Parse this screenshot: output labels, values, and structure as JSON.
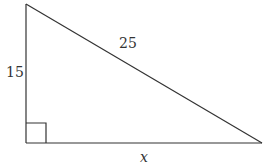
{
  "diagram": {
    "type": "right-triangle",
    "colors": {
      "stroke": "#333333",
      "background": "#ffffff",
      "text": "#333333"
    },
    "vertices": {
      "top": [
        26,
        4
      ],
      "right_angle": [
        26,
        143
      ],
      "right": [
        262,
        143
      ]
    },
    "right_angle_marker_size": 20,
    "labels": {
      "left_side": "15",
      "hypotenuse": "25",
      "bottom_side": "x"
    }
  }
}
